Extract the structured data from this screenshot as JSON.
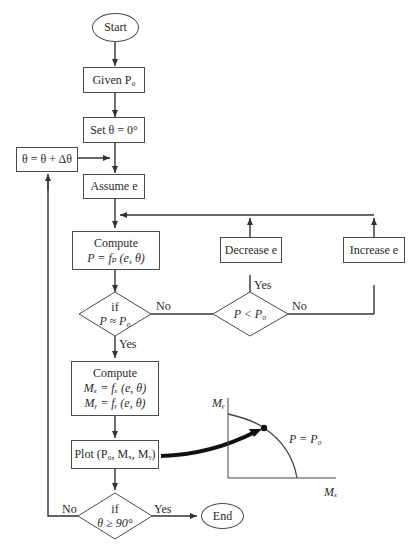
{
  "flowchart": {
    "start": "Start",
    "given": "Given P₀",
    "set_theta": "Set θ = 0°",
    "increment_theta": "θ = θ + Δθ",
    "assume_e": "Assume e",
    "compute_p": {
      "title": "Compute",
      "formula": "P = fₚ (e, θ)"
    },
    "decision_p_approx": {
      "line1": "if",
      "line2": "P ≈ P₀"
    },
    "decision_p_less": {
      "line1": "P < P₀"
    },
    "decrease_e": "Decrease e",
    "increase_e": "Increase e",
    "compute_m": {
      "title": "Compute",
      "mx": "Mₓ = fₓ (e, θ)",
      "my": "Mᵧ = fᵧ (e, θ)"
    },
    "plot": "Plot (P₀, Mₓ, Mᵧ)",
    "decision_theta": {
      "line1": "if",
      "line2": "θ ≥ 90°"
    },
    "end": "End",
    "edge_labels": {
      "approx_no": "No",
      "approx_yes": "Yes",
      "less_yes": "Yes",
      "less_no": "No",
      "theta_no": "No",
      "theta_yes": "Yes"
    }
  },
  "inset_plot": {
    "y_axis_label": "Mᵧ",
    "x_axis_label": "Mₓ",
    "curve_label": "P = P₀"
  }
}
